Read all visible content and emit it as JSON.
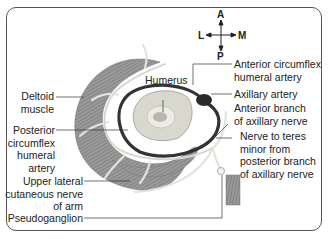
{
  "compass": {
    "anterior": "A",
    "posterior": "P",
    "lateral": "L",
    "medial": "M"
  },
  "labels": {
    "humerus": "Humerus",
    "deltoid_1": "Deltoid",
    "deltoid_2": "muscle",
    "pcha_1": "Posterior",
    "pcha_2": "circumflex",
    "pcha_3": "humeral",
    "pcha_4": "artery",
    "ulcn_1": "Upper lateral",
    "ulcn_2": "cutaneous nerve",
    "ulcn_3": "of arm",
    "pseudoganglion": "Pseudoganglion",
    "acha_1": "Anterior circumflex",
    "acha_2": "humeral artery",
    "axillary_artery": "Axillary artery",
    "anterior_branch_1": "Anterior branch",
    "anterior_branch_2": "of axillary nerve",
    "teres_1": "Nerve to teres",
    "teres_2": "minor from",
    "teres_3": "posterior branch",
    "teres_4": "of axillary nerve"
  },
  "colors": {
    "border": "#555555",
    "muscle": "#8a8a8a",
    "artery": "#2a2a2a",
    "nerve": "#e8e8e0",
    "bone": "#c8c8c0"
  }
}
